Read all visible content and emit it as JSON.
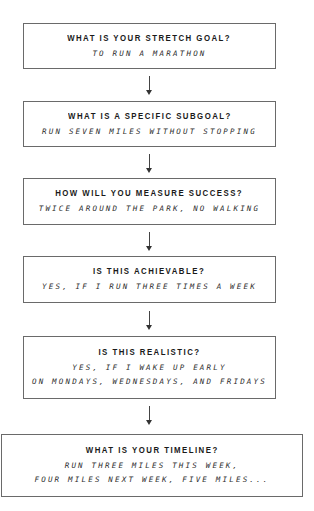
{
  "flowchart": {
    "steps": [
      {
        "question": "WHAT IS YOUR STRETCH GOAL?",
        "answer_lines": [
          "TO RUN A MARATHON"
        ]
      },
      {
        "question": "WHAT IS A SPECIFIC SUBGOAL?",
        "answer_lines": [
          "RUN SEVEN MILES WITHOUT STOPPING"
        ]
      },
      {
        "question": "HOW WILL YOU MEASURE SUCCESS?",
        "answer_lines": [
          "TWICE AROUND THE PARK, NO WALKING"
        ]
      },
      {
        "question": "IS THIS ACHIEVABLE?",
        "answer_lines": [
          "YES, IF I RUN THREE TIMES A WEEK"
        ]
      },
      {
        "question": "IS THIS REALISTIC?",
        "answer_lines": [
          "YES, IF I WAKE UP EARLY",
          "ON MONDAYS, WEDNESDAYS, AND FRIDAYS"
        ]
      },
      {
        "question": "WHAT IS YOUR TIMELINE?",
        "answer_lines": [
          "RUN THREE MILES THIS WEEK,",
          "FOUR MILES NEXT WEEK, FIVE MILES..."
        ]
      }
    ],
    "arrow_icon": "down-arrow-icon",
    "colors": {
      "border": "#6a6a6a",
      "text": "#1a1a1a",
      "background": "#ffffff"
    }
  }
}
